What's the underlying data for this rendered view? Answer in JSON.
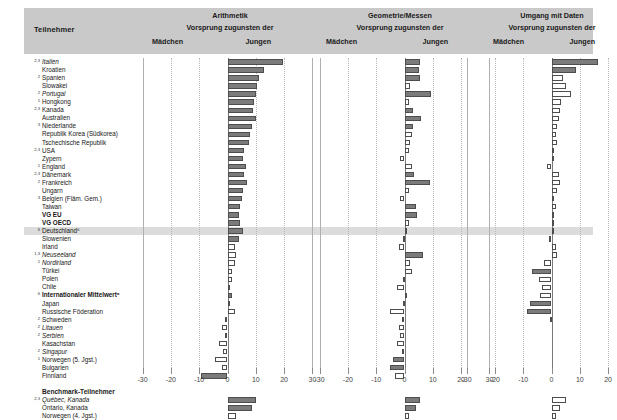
{
  "header": {
    "participant_label": "Teilnehmer",
    "panels": [
      {
        "title": "Arithmetik",
        "subtitle": "Vorsprung zugunsten der",
        "left_label": "Mädchen",
        "right_label": "Jungen"
      },
      {
        "title": "Geometrie/Messen",
        "subtitle": "Vorsprung zugunsten der",
        "left_label": "Mädchen",
        "right_label": "Jungen"
      },
      {
        "title": "Umgang mit Daten",
        "subtitle": "Vorsprung zugunsten der",
        "left_label": "Mädchen",
        "right_label": "Jungen"
      }
    ]
  },
  "group_headers": {
    "benchmark": "Benchmark-Teilnehmer"
  },
  "axis": {
    "ticks": [
      -30,
      -20,
      -10,
      0,
      10,
      20,
      30
    ],
    "tick_labels": [
      "-30",
      "-20",
      "-10",
      "0",
      "10",
      "20",
      "30"
    ],
    "xlim": [
      -33,
      33
    ]
  },
  "colors": {
    "header_band": "#c9c9c9",
    "highlight_row": "#dcdcdc",
    "bar_fill": "#7b7b7b",
    "bar_open": "#ffffff",
    "bar_edge": "#4d4d4d"
  },
  "chart_data": {
    "type": "bar",
    "xlabel": "Vorsprung zugunsten der Mädchen / Jungen",
    "ylabel": "Teilnehmer",
    "xlim": [
      -33,
      33
    ],
    "grid": true,
    "legend": [
      "ausgefüllt = statistisch signifikant",
      "offen = nicht signifikant"
    ],
    "series": [
      {
        "name": "Arithmetik"
      },
      {
        "name": "Geometrie/Messen"
      },
      {
        "name": "Umgang mit Daten"
      }
    ],
    "categories": [
      "Italien",
      "Kroatien",
      "Spanien",
      "Slowakei",
      "Portugal",
      "Hongkong",
      "Kanada",
      "Australien",
      "Niederlande",
      "Republik Korea (Südkorea)",
      "Tschechische Republik",
      "USA",
      "Zypern",
      "England",
      "Dänemark",
      "Frankreich",
      "Ungarn",
      "Belgien (Fläm. Gem.)",
      "Taiwan",
      "VG EU",
      "VG OECD",
      "Deutschland",
      "Slowenien",
      "Irland",
      "Neuseeland",
      "Nordirland",
      "Türkei",
      "Polen",
      "Chile",
      "Internationaler Mittelwert",
      "Japan",
      "Russische Föderation",
      "Schweden",
      "Litauen",
      "Serbien",
      "Kasachstan",
      "Singapur",
      "Norwegen (5. Jgst.)",
      "Bulgarien",
      "Finnland",
      "Québec, Kanada",
      "Ontario, Kanada",
      "Norwegen (4. Jgst.)"
    ],
    "rows": [
      {
        "label": "Italien",
        "sup": "2,3",
        "style": "italic",
        "arithmetik": 19.5,
        "arithmetik_sig": true,
        "geometrie": 5.5,
        "geometrie_sig": true,
        "daten": 16.5,
        "daten_sig": true
      },
      {
        "label": "Kroatien",
        "sup": "",
        "style": "normal",
        "arithmetik": 13.0,
        "arithmetik_sig": true,
        "geometrie": 5.0,
        "geometrie_sig": true,
        "daten": 8.5,
        "daten_sig": true
      },
      {
        "label": "Spanien",
        "sup": "2",
        "style": "normal",
        "arithmetik": 11.0,
        "arithmetik_sig": true,
        "geometrie": 5.5,
        "geometrie_sig": true,
        "daten": 4.0,
        "daten_sig": false
      },
      {
        "label": "Slowakei",
        "sup": "",
        "style": "normal",
        "arithmetik": 10.5,
        "arithmetik_sig": true,
        "geometrie": 2.0,
        "geometrie_sig": false,
        "daten": 5.0,
        "daten_sig": false
      },
      {
        "label": "Portugal",
        "sup": "2",
        "style": "italic",
        "arithmetik": 10.0,
        "arithmetik_sig": true,
        "geometrie": 9.5,
        "geometrie_sig": true,
        "daten": 7.0,
        "daten_sig": false
      },
      {
        "label": "Hongkong",
        "sup": "1",
        "style": "normal",
        "arithmetik": 9.5,
        "arithmetik_sig": true,
        "geometrie": 1.5,
        "geometrie_sig": false,
        "daten": 3.5,
        "daten_sig": false
      },
      {
        "label": "Kanada",
        "sup": "2,3",
        "style": "normal",
        "arithmetik": 9.0,
        "arithmetik_sig": true,
        "geometrie": 3.0,
        "geometrie_sig": true,
        "daten": 3.0,
        "daten_sig": false
      },
      {
        "label": "Australien",
        "sup": "",
        "style": "normal",
        "arithmetik": 10.0,
        "arithmetik_sig": true,
        "geometrie": 6.0,
        "geometrie_sig": true,
        "daten": 2.5,
        "daten_sig": false
      },
      {
        "label": "Niederlande",
        "sup": "3",
        "style": "normal",
        "arithmetik": 8.5,
        "arithmetik_sig": true,
        "geometrie": 3.0,
        "geometrie_sig": true,
        "daten": 2.0,
        "daten_sig": false
      },
      {
        "label": "Republik Korea (Südkorea)",
        "sup": "",
        "style": "normal",
        "arithmetik": 8.0,
        "arithmetik_sig": true,
        "geometrie": 2.5,
        "geometrie_sig": false,
        "daten": 1.5,
        "daten_sig": false
      },
      {
        "label": "Tschechische Republik",
        "sup": "",
        "style": "normal",
        "arithmetik": 7.5,
        "arithmetik_sig": true,
        "geometrie": 2.0,
        "geometrie_sig": false,
        "daten": 2.0,
        "daten_sig": false
      },
      {
        "label": "USA",
        "sup": "2,3",
        "style": "normal",
        "arithmetik": 6.0,
        "arithmetik_sig": true,
        "geometrie": 1.5,
        "geometrie_sig": false,
        "daten": 1.0,
        "daten_sig": false
      },
      {
        "label": "Zypern",
        "sup": "",
        "style": "normal",
        "arithmetik": 5.5,
        "arithmetik_sig": true,
        "geometrie": -1.5,
        "geometrie_sig": false,
        "daten": 1.0,
        "daten_sig": false
      },
      {
        "label": "England",
        "sup": "1",
        "style": "normal",
        "arithmetik": 6.5,
        "arithmetik_sig": true,
        "geometrie": 2.5,
        "geometrie_sig": false,
        "daten": -1.5,
        "daten_sig": false
      },
      {
        "label": "Dänemark",
        "sup": "2,3",
        "style": "normal",
        "arithmetik": 6.0,
        "arithmetik_sig": true,
        "geometrie": 3.5,
        "geometrie_sig": true,
        "daten": 2.5,
        "daten_sig": false
      },
      {
        "label": "Frankreich",
        "sup": "2",
        "style": "normal",
        "arithmetik": 7.0,
        "arithmetik_sig": true,
        "geometrie": 9.0,
        "geometrie_sig": true,
        "daten": 3.0,
        "daten_sig": false
      },
      {
        "label": "Ungarn",
        "sup": "",
        "style": "normal",
        "arithmetik": 5.5,
        "arithmetik_sig": true,
        "geometrie": 1.5,
        "geometrie_sig": false,
        "daten": 2.0,
        "daten_sig": false
      },
      {
        "label": "Belgien (Fläm. Gem.)",
        "sup": "3",
        "style": "normal",
        "arithmetik": 5.0,
        "arithmetik_sig": true,
        "geometrie": -1.5,
        "geometrie_sig": false,
        "daten": 1.0,
        "daten_sig": false
      },
      {
        "label": "Taiwan",
        "sup": "",
        "style": "normal",
        "arithmetik": 4.5,
        "arithmetik_sig": true,
        "geometrie": 4.0,
        "geometrie_sig": true,
        "daten": 1.5,
        "daten_sig": false
      },
      {
        "label": "VG EU",
        "sup": "",
        "style": "bold",
        "arithmetik": 4.0,
        "arithmetik_sig": true,
        "geometrie": 4.5,
        "geometrie_sig": true,
        "daten": 1.0,
        "daten_sig": false
      },
      {
        "label": "VG OECD",
        "sup": "",
        "style": "bold",
        "arithmetik": 4.5,
        "arithmetik_sig": true,
        "geometrie": 1.5,
        "geometrie_sig": false,
        "daten": 0.5,
        "daten_sig": false
      },
      {
        "label": "Deutschland",
        "sup": "6",
        "style": "normal",
        "highlight": true,
        "arithmetik": 5.5,
        "arithmetik_sig": true,
        "geometrie": 1.0,
        "geometrie_sig": false,
        "daten": 1.0,
        "daten_sig": false
      },
      {
        "label": "Slowenien",
        "sup": "",
        "style": "normal",
        "arithmetik": 4.0,
        "arithmetik_sig": true,
        "geometrie": -0.5,
        "geometrie_sig": false,
        "daten": -1.0,
        "daten_sig": false
      },
      {
        "label": "Irland",
        "sup": "",
        "style": "normal",
        "arithmetik": 2.5,
        "arithmetik_sig": false,
        "geometrie": -2.0,
        "geometrie_sig": false,
        "daten": 1.5,
        "daten_sig": false
      },
      {
        "label": "Neuseeland",
        "sup": "1,3",
        "style": "italic",
        "arithmetik": 3.0,
        "arithmetik_sig": false,
        "geometrie": 6.5,
        "geometrie_sig": true,
        "daten": 2.0,
        "daten_sig": false
      },
      {
        "label": "Nordirland",
        "sup": "1",
        "style": "italic",
        "arithmetik": 2.5,
        "arithmetik_sig": false,
        "geometrie": 2.0,
        "geometrie_sig": false,
        "daten": -2.5,
        "daten_sig": false
      },
      {
        "label": "Türkei",
        "sup": "",
        "style": "normal",
        "arithmetik": 1.5,
        "arithmetik_sig": false,
        "geometrie": 2.5,
        "geometrie_sig": false,
        "daten": -7.0,
        "daten_sig": true
      },
      {
        "label": "Polen",
        "sup": "",
        "style": "normal",
        "arithmetik": 1.5,
        "arithmetik_sig": false,
        "geometrie": -0.5,
        "geometrie_sig": false,
        "daten": -4.5,
        "daten_sig": false
      },
      {
        "label": "Chile",
        "sup": "",
        "style": "normal",
        "arithmetik": 1.0,
        "arithmetik_sig": false,
        "geometrie": -2.5,
        "geometrie_sig": false,
        "daten": -3.5,
        "daten_sig": false
      },
      {
        "label": "Internationaler Mittelwert",
        "sup": "6",
        "style": "bold",
        "arithmetik": 1.5,
        "arithmetik_sig": true,
        "geometrie": 0.5,
        "geometrie_sig": false,
        "daten": -4.0,
        "daten_sig": false
      },
      {
        "label": "Japan",
        "sup": "",
        "style": "normal",
        "arithmetik": 0.5,
        "arithmetik_sig": false,
        "geometrie": -0.5,
        "geometrie_sig": false,
        "daten": -7.5,
        "daten_sig": true
      },
      {
        "label": "Russische Föderation",
        "sup": "",
        "style": "normal",
        "arithmetik": 2.5,
        "arithmetik_sig": false,
        "geometrie": -5.0,
        "geometrie_sig": false,
        "daten": -8.5,
        "daten_sig": true
      },
      {
        "label": "Schweden",
        "sup": "2",
        "style": "normal",
        "arithmetik": -1.0,
        "arithmetik_sig": false,
        "geometrie": -1.0,
        "geometrie_sig": false,
        "daten": -0.5,
        "daten_sig": false
      },
      {
        "label": "Litauen",
        "sup": "2",
        "style": "italic",
        "arithmetik": -2.0,
        "arithmetik_sig": false,
        "geometrie": -2.0,
        "geometrie_sig": false,
        "daten": 0.0,
        "daten_sig": false
      },
      {
        "label": "Serbien",
        "sup": "2",
        "style": "italic",
        "arithmetik": -1.0,
        "arithmetik_sig": false,
        "geometrie": -1.5,
        "geometrie_sig": false,
        "daten": 0.0,
        "daten_sig": false
      },
      {
        "label": "Kasachstan",
        "sup": "",
        "style": "normal",
        "arithmetik": -3.0,
        "arithmetik_sig": false,
        "geometrie": -2.5,
        "geometrie_sig": false,
        "daten": 0.0,
        "daten_sig": false
      },
      {
        "label": "Singapur",
        "sup": "2",
        "style": "italic",
        "arithmetik": -1.5,
        "arithmetik_sig": false,
        "geometrie": -1.0,
        "geometrie_sig": false,
        "daten": 0.0,
        "daten_sig": false
      },
      {
        "label": "Norwegen (5. Jgst.)",
        "sup": "1",
        "style": "normal",
        "arithmetik": -4.5,
        "arithmetik_sig": false,
        "geometrie": -4.0,
        "geometrie_sig": true,
        "daten": 0.0,
        "daten_sig": false
      },
      {
        "label": "Bulgarien",
        "sup": "",
        "style": "normal",
        "arithmetik": -2.0,
        "arithmetik_sig": false,
        "geometrie": -5.0,
        "geometrie_sig": true,
        "daten": 0.0,
        "daten_sig": false
      },
      {
        "label": "Finnland",
        "sup": "",
        "style": "normal",
        "arithmetik": -9.5,
        "arithmetik_sig": true,
        "geometrie": -3.5,
        "geometrie_sig": false,
        "daten": 0.0,
        "daten_sig": false
      },
      {
        "label": "Québec, Kanada",
        "sup": "2,3",
        "style": "italic",
        "arithmetik": 10.0,
        "arithmetik_sig": true,
        "geometrie": 5.5,
        "geometrie_sig": true,
        "daten": 5.0,
        "daten_sig": false
      },
      {
        "label": "Ontario, Kanada",
        "sup": "",
        "style": "normal",
        "arithmetik": 8.5,
        "arithmetik_sig": true,
        "geometrie": 4.0,
        "geometrie_sig": true,
        "daten": 3.0,
        "daten_sig": false
      },
      {
        "label": "Norwegen (4. Jgst.)",
        "sup": "",
        "style": "normal",
        "arithmetik": 3.0,
        "arithmetik_sig": false,
        "geometrie": 1.5,
        "geometrie_sig": false,
        "daten": 1.5,
        "daten_sig": false
      }
    ]
  }
}
